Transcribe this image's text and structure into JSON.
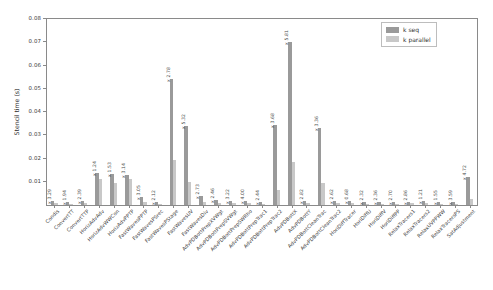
{
  "chart_data": {
    "type": "bar",
    "title": "",
    "xlabel": "",
    "ylabel": "Stencil time (s)",
    "ylim": [
      0,
      0.08
    ],
    "yticks": [
      0.01,
      0.02,
      0.03,
      0.04,
      0.05,
      0.06,
      0.07,
      0.08
    ],
    "ytick_labels": [
      "0.01",
      "0.02",
      "0.03",
      "0.04",
      "0.05",
      "0.06",
      "0.07",
      "0.08"
    ],
    "grid": false,
    "legend_position": "top-right",
    "categories": [
      "Condis",
      "ConvertTT",
      "ConvertTTP",
      "HorizAdvAdv",
      "HorizAdvWWCon",
      "HorizAdvPPTP",
      "FastWavesPPTP",
      "FastWavesPSrec",
      "FastWavesPStage",
      "FastWavesUV",
      "FastWavesDiv",
      "AdvPDBottPrepXVWgt",
      "AdvPDBottPrepSVWgt",
      "AdvPDBottPrepSWRho",
      "AdvPDBottPrepTrac1",
      "AdvPDBottPrepTrac2",
      "AdvPDBottX",
      "AdvPDBottY",
      "AdvPDBottCleanTrac",
      "AdvPDBottCleanTrac2",
      "HoriDiffTracer",
      "HoriDiffU",
      "HoriDiffV",
      "HoriDiffPP",
      "RelaxTracers1",
      "RelaxTracers2",
      "RelaxUVPPWW",
      "RelaxTracersPS",
      "SatAdjustment"
    ],
    "series": [
      {
        "name": "k seq",
        "color": "#9a9a9a",
        "values": [
          0.0016,
          0.0013,
          0.0018,
          0.0138,
          0.0135,
          0.013,
          0.0033,
          0.0011,
          0.054,
          0.034,
          0.004,
          0.002,
          0.0018,
          0.0016,
          0.0014,
          0.0345,
          0.07,
          0.0019,
          0.033,
          0.0018,
          0.0016,
          0.0014,
          0.0013,
          0.0013,
          0.0015,
          0.0016,
          0.0013,
          0.0012,
          0.012
        ]
      },
      {
        "name": "k parallel",
        "color": "#c8c8c8",
        "values": [
          0.0009,
          0.0006,
          0.0008,
          0.0111,
          0.0096,
          0.011,
          0.0013,
          0.0006,
          0.0195,
          0.01,
          0.0014,
          0.0009,
          0.0008,
          0.0008,
          0.0006,
          0.0065,
          0.0185,
          0.0008,
          0.0095,
          0.0008,
          0.0007,
          0.0006,
          0.0005,
          0.0006,
          0.0007,
          0.0007,
          0.0006,
          0.0005,
          0.0026
        ]
      }
    ],
    "annotations": [
      "x 3.29",
      "x 1.94",
      "x 2.39",
      "x 1.24",
      "x 1.53",
      "x 3.14",
      "x 3.05",
      "x 2.12",
      "x 2.78",
      "x 5.32",
      "x 2.73",
      "x 2.46",
      "x 3.22",
      "x 4.00",
      "x 2.44",
      "x 3.68",
      "x 5.81",
      "x 2.82",
      "x 3.36",
      "x 2.62",
      "x 0.68",
      "x 2.32",
      "x 2.36",
      "x 2.70",
      "x 2.86",
      "x 1.21",
      "x 1.55",
      "x 3.59",
      "x 4.72"
    ]
  },
  "legend": {
    "items": [
      {
        "label": "k seq",
        "color": "#9a9a9a"
      },
      {
        "label": "k parallel",
        "color": "#c8c8c8"
      }
    ]
  }
}
